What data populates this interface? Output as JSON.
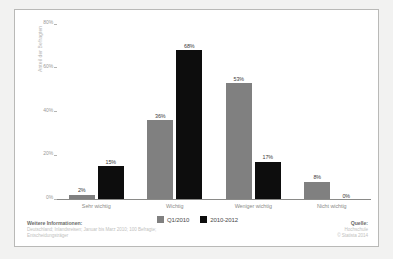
{
  "chart_data": {
    "type": "bar",
    "title": "",
    "subtitle": "",
    "xlabel": "",
    "ylabel": "Anteil der Befragten",
    "ylim": [
      0,
      80
    ],
    "yticks": [
      "0%",
      "20%",
      "40%",
      "60%",
      "80%"
    ],
    "ytick_values": [
      0,
      20,
      40,
      60,
      80
    ],
    "grid": false,
    "legend_position": "bottom-center",
    "categories": [
      "Sehr wichtig",
      "Wichtig",
      "Weniger wichtig",
      "Nicht wichtig"
    ],
    "series": [
      {
        "name": "Q1/2010",
        "color": "#808080",
        "values": [
          2,
          36,
          53,
          8
        ],
        "labels": [
          "2%",
          "36%",
          "53%",
          "8%"
        ]
      },
      {
        "name": "2010-2012",
        "color": "#0d0d0d",
        "values": [
          15,
          68,
          17,
          0
        ],
        "labels": [
          "15%",
          "68%",
          "17%",
          "0%"
        ]
      }
    ]
  },
  "footer": {
    "left_heading": "Weitere Informationen:",
    "left_lines": [
      "Deutschland; Inlandsreisen; Januar bis Marz 2010; 100 Befragte;",
      "Entscheidungsträger"
    ],
    "right_heading": "Quelle:",
    "right_lines": [
      "Hochschule",
      "© Statista 2014"
    ]
  },
  "colors": {
    "series_1": "#808080",
    "series_2": "#0d0d0d",
    "panel_background": "#ffffff",
    "page_background": "#f2f2f1",
    "axis": "#8a8a88"
  }
}
